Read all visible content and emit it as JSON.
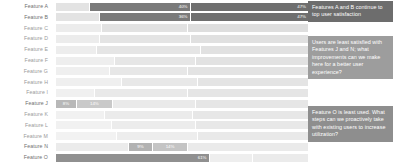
{
  "chart_data": {
    "type": "bar",
    "title": "",
    "xlabel": "",
    "ylabel": "",
    "orientation": "horizontal",
    "stacked": true,
    "grid": false,
    "legend": "none",
    "xlim": [
      0,
      100
    ],
    "categories": [
      "Feature A",
      "Feature B",
      "Feature C",
      "Feature D",
      "Feature E",
      "Feature F",
      "Feature G",
      "Feature H",
      "Feature I",
      "Feature J",
      "Feature K",
      "Feature L",
      "Feature M",
      "Feature N",
      "Feature O"
    ],
    "rows": [
      {
        "label": "Feature A",
        "highlighted": true,
        "segments": [
          {
            "value": 13,
            "color": "#e3e3e3",
            "label": "",
            "dark": false
          },
          {
            "value": 40,
            "color": "#7a7a7a",
            "label": "40%",
            "dark": true
          },
          {
            "value": 47,
            "color": "#6f6f6f",
            "label": "47%",
            "dark": true
          }
        ]
      },
      {
        "label": "Feature B",
        "highlighted": true,
        "segments": [
          {
            "value": 17,
            "color": "#e3e3e3",
            "label": "",
            "dark": false
          },
          {
            "value": 36,
            "color": "#7a7a7a",
            "label": "36%",
            "dark": true
          },
          {
            "value": 47,
            "color": "#6f6f6f",
            "label": "47%",
            "dark": true
          }
        ]
      },
      {
        "label": "Feature C",
        "highlighted": false,
        "segments": [
          {
            "value": 18,
            "color": "#ececec",
            "label": "",
            "dark": false
          },
          {
            "value": 34,
            "color": "#e2e2e2",
            "label": "",
            "dark": false
          },
          {
            "value": 48,
            "color": "#dedede",
            "label": "",
            "dark": false
          }
        ]
      },
      {
        "label": "Feature D",
        "highlighted": false,
        "segments": [
          {
            "value": 17,
            "color": "#ececec",
            "label": "",
            "dark": false
          },
          {
            "value": 36,
            "color": "#e4e4e4",
            "label": "",
            "dark": false
          },
          {
            "value": 47,
            "color": "#e0e0e0",
            "label": "",
            "dark": false
          }
        ]
      },
      {
        "label": "Feature E",
        "highlighted": false,
        "segments": [
          {
            "value": 16,
            "color": "#ededed",
            "label": "",
            "dark": false
          },
          {
            "value": 41,
            "color": "#e5e5e5",
            "label": "",
            "dark": false
          },
          {
            "value": 43,
            "color": "#e1e1e1",
            "label": "",
            "dark": false
          }
        ]
      },
      {
        "label": "Feature F",
        "highlighted": false,
        "segments": [
          {
            "value": 23,
            "color": "#eeeeee",
            "label": "",
            "dark": false
          },
          {
            "value": 32,
            "color": "#e6e6e6",
            "label": "",
            "dark": false
          },
          {
            "value": 45,
            "color": "#e2e2e2",
            "label": "",
            "dark": false
          }
        ]
      },
      {
        "label": "Feature G",
        "highlighted": false,
        "segments": [
          {
            "value": 21,
            "color": "#efefef",
            "label": "",
            "dark": false
          },
          {
            "value": 31,
            "color": "#e7e7e7",
            "label": "",
            "dark": false
          },
          {
            "value": 48,
            "color": "#e3e3e3",
            "label": "",
            "dark": false
          }
        ]
      },
      {
        "label": "Feature H",
        "highlighted": false,
        "segments": [
          {
            "value": 26,
            "color": "#efefef",
            "label": "",
            "dark": false
          },
          {
            "value": 30,
            "color": "#e8e8e8",
            "label": "",
            "dark": false
          },
          {
            "value": 44,
            "color": "#e4e4e4",
            "label": "",
            "dark": false
          }
        ]
      },
      {
        "label": "Feature I",
        "highlighted": false,
        "segments": [
          {
            "value": 15,
            "color": "#f0f0f0",
            "label": "",
            "dark": false
          },
          {
            "value": 37,
            "color": "#e9e9e9",
            "label": "",
            "dark": false
          },
          {
            "value": 48,
            "color": "#e5e5e5",
            "label": "",
            "dark": false
          }
        ]
      },
      {
        "label": "Feature J",
        "highlighted": true,
        "segments": [
          {
            "value": 8,
            "color": "#b8b8b8",
            "label": "8%",
            "dark": true
          },
          {
            "value": 14,
            "color": "#c9c9c9",
            "label": "14%",
            "dark": true
          },
          {
            "value": 33,
            "color": "#eaeaea",
            "label": "",
            "dark": false
          },
          {
            "value": 45,
            "color": "#e6e6e6",
            "label": "",
            "dark": false
          }
        ]
      },
      {
        "label": "Feature K",
        "highlighted": false,
        "segments": [
          {
            "value": 19,
            "color": "#f1f1f1",
            "label": "",
            "dark": false
          },
          {
            "value": 35,
            "color": "#ebebeb",
            "label": "",
            "dark": false
          },
          {
            "value": 46,
            "color": "#e7e7e7",
            "label": "",
            "dark": false
          }
        ]
      },
      {
        "label": "Feature L",
        "highlighted": false,
        "segments": [
          {
            "value": 22,
            "color": "#f1f1f1",
            "label": "",
            "dark": false
          },
          {
            "value": 33,
            "color": "#ececec",
            "label": "",
            "dark": false
          },
          {
            "value": 45,
            "color": "#e8e8e8",
            "label": "",
            "dark": false
          }
        ]
      },
      {
        "label": "Feature M",
        "highlighted": false,
        "segments": [
          {
            "value": 24,
            "color": "#f2f2f2",
            "label": "",
            "dark": false
          },
          {
            "value": 32,
            "color": "#ededed",
            "label": "",
            "dark": false
          },
          {
            "value": 44,
            "color": "#e9e9e9",
            "label": "",
            "dark": false
          }
        ]
      },
      {
        "label": "Feature N",
        "highlighted": true,
        "segments": [
          {
            "value": 29,
            "color": "#ebebeb",
            "label": "",
            "dark": false
          },
          {
            "value": 9,
            "color": "#b2b2b2",
            "label": "9%",
            "dark": true
          },
          {
            "value": 14,
            "color": "#c4c4c4",
            "label": "14%",
            "dark": true
          },
          {
            "value": 48,
            "color": "#eaeaea",
            "label": "",
            "dark": false
          }
        ]
      },
      {
        "label": "Feature O",
        "highlighted": true,
        "segments": [
          {
            "value": 61,
            "color": "#909090",
            "label": "61%",
            "dark": true
          },
          {
            "value": 17,
            "color": "#eeeeee",
            "label": "",
            "dark": false
          },
          {
            "value": 22,
            "color": "#ebebeb",
            "label": "",
            "dark": false
          }
        ]
      }
    ]
  },
  "annotations": [
    {
      "text": "Features A and B continue to top user satisfaction",
      "color": "#6d6d6d"
    },
    {
      "text": "Users are least satisfied with Features J and N; what improvements can we make here for a better user experience?",
      "color": "#9d9d9d"
    },
    {
      "text": "Feature O is least used. What steps can we proactively take with existing users to increase utilization?",
      "color": "#8e8e8e"
    }
  ]
}
